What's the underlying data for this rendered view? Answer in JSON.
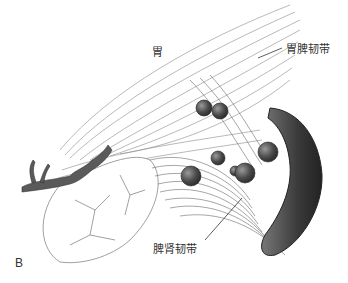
{
  "figure": {
    "panel_label": "B",
    "labels": {
      "stomach": "胃",
      "gastrosplenic_ligament": "胃脾韧带",
      "splenorenal_ligament": "脾肾韧带"
    },
    "colors": {
      "line": "#555555",
      "shade_dark": "#3a3a3a",
      "shade_mid": "#777777",
      "node": "#4a4a4a",
      "background": "#ffffff"
    }
  }
}
